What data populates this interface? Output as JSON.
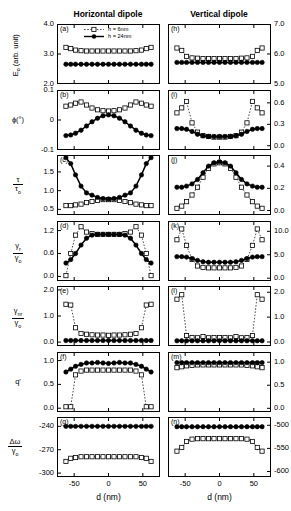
{
  "figure": {
    "columns": [
      {
        "title": "Horizontal dipole"
      },
      {
        "title": "Vertical dipole"
      }
    ],
    "xaxis_title": "d (nm)",
    "legend": [
      {
        "label": "h = 6nm",
        "style": "dashed-open-square"
      },
      {
        "label": "h = 24nm",
        "style": "solid-filled-circle"
      }
    ]
  },
  "chart_data": {
    "type": "line",
    "xlabel": "d (nm)",
    "xlim": [
      -75,
      75
    ],
    "xticks": [
      -50,
      0,
      50
    ],
    "grid": false,
    "legend_position": "panel-a-top",
    "series_names": [
      "h = 6nm",
      "h = 24nm"
    ],
    "x": [
      -62,
      -55,
      -48,
      -40,
      -32,
      -24,
      -16,
      -8,
      0,
      8,
      16,
      24,
      32,
      40,
      48,
      55,
      62
    ],
    "panels": [
      {
        "id": "a",
        "column": "Horizontal dipole",
        "ylabel": "E_o (arb. unit)",
        "ylim": [
          2.0,
          4.0
        ],
        "yticks": [
          2.0,
          3.0,
          4.0
        ],
        "ytick_labels": [
          "2.0",
          "3.0",
          "4.0"
        ],
        "axis_side": "left",
        "series": [
          {
            "name": "h = 6nm",
            "values": [
              3.22,
              3.18,
              3.13,
              3.11,
              3.1,
              3.1,
              3.1,
              3.1,
              3.1,
              3.1,
              3.1,
              3.1,
              3.1,
              3.11,
              3.13,
              3.18,
              3.22
            ]
          },
          {
            "name": "h = 24nm",
            "values": [
              2.66,
              2.66,
              2.66,
              2.66,
              2.66,
              2.66,
              2.66,
              2.66,
              2.66,
              2.66,
              2.66,
              2.66,
              2.66,
              2.66,
              2.66,
              2.66,
              2.66
            ]
          }
        ]
      },
      {
        "id": "b",
        "column": "Horizontal dipole",
        "ylabel": "phi (deg)",
        "ylim": [
          -0.1,
          0.1
        ],
        "yticks": [
          -0.1,
          0.0,
          0.1
        ],
        "ytick_labels": [
          "-0.1",
          "0",
          "0.1"
        ],
        "axis_side": "left",
        "series": [
          {
            "name": "h = 6nm",
            "values": [
              0.046,
              0.05,
              0.056,
              0.06,
              0.05,
              0.04,
              0.034,
              0.031,
              0.03,
              0.031,
              0.034,
              0.04,
              0.05,
              0.06,
              0.056,
              0.05,
              0.046
            ]
          },
          {
            "name": "h = 24nm",
            "values": [
              -0.052,
              -0.05,
              -0.044,
              -0.034,
              -0.02,
              -0.006,
              0.006,
              0.014,
              0.017,
              0.014,
              0.006,
              -0.006,
              -0.02,
              -0.034,
              -0.044,
              -0.05,
              -0.052
            ]
          }
        ]
      },
      {
        "id": "c",
        "column": "Horizontal dipole",
        "ylabel": "tau / tau_o",
        "ylim": [
          0.35,
          1.95
        ],
        "yticks": [
          0.5,
          1.0,
          1.5
        ],
        "ytick_labels": [
          "0.5",
          "1.0",
          "1.5"
        ],
        "axis_side": "left",
        "series": [
          {
            "name": "h = 6nm",
            "values": [
              0.6,
              0.6,
              0.62,
              0.64,
              0.68,
              0.71,
              0.74,
              0.76,
              0.76,
              0.76,
              0.74,
              0.71,
              0.68,
              0.64,
              0.62,
              0.6,
              0.6
            ]
          },
          {
            "name": "h = 24nm",
            "values": [
              1.88,
              1.72,
              1.42,
              1.12,
              0.94,
              0.88,
              0.82,
              0.79,
              0.78,
              0.79,
              0.82,
              0.88,
              0.94,
              1.12,
              1.42,
              1.72,
              1.88
            ]
          }
        ]
      },
      {
        "id": "d",
        "column": "Horizontal dipole",
        "ylabel": "gamma_r / gamma_o",
        "ylim": [
          -0.12,
          1.45
        ],
        "yticks": [
          0.0,
          0.6,
          1.2
        ],
        "ytick_labels": [
          "0.0",
          "0.6",
          "1.2"
        ],
        "axis_side": "left",
        "series": [
          {
            "name": "h = 6nm",
            "values": [
              0.02,
              0.6,
              1.08,
              1.3,
              1.16,
              1.12,
              1.1,
              1.1,
              1.1,
              1.1,
              1.1,
              1.12,
              1.16,
              1.3,
              1.08,
              0.6,
              0.02
            ]
          },
          {
            "name": "h = 24nm",
            "values": [
              0.35,
              0.44,
              0.6,
              0.82,
              1.0,
              1.08,
              1.1,
              1.1,
              1.1,
              1.1,
              1.1,
              1.08,
              1.0,
              0.82,
              0.6,
              0.44,
              0.35
            ]
          }
        ]
      },
      {
        "id": "e",
        "column": "Horizontal dipole",
        "ylabel": "gamma_nr / gamma_o",
        "ylim": [
          -0.15,
          2.15
        ],
        "yticks": [
          0.0,
          1.0,
          2.0
        ],
        "ytick_labels": [
          "0.0",
          "1.0",
          "2.0"
        ],
        "axis_side": "left",
        "series": [
          {
            "name": "h = 6nm",
            "values": [
              1.45,
              1.42,
              0.55,
              0.33,
              0.3,
              0.28,
              0.27,
              0.27,
              0.26,
              0.27,
              0.27,
              0.28,
              0.3,
              0.33,
              0.55,
              1.42,
              1.45
            ]
          },
          {
            "name": "h = 24nm",
            "values": [
              0.06,
              0.06,
              0.06,
              0.06,
              0.06,
              0.06,
              0.06,
              0.06,
              0.06,
              0.06,
              0.06,
              0.06,
              0.06,
              0.06,
              0.06,
              0.06,
              0.06
            ]
          }
        ]
      },
      {
        "id": "f",
        "column": "Horizontal dipole",
        "ylabel": "q'",
        "ylim": [
          -0.08,
          1.18
        ],
        "yticks": [
          0.0,
          0.5,
          1.0
        ],
        "ytick_labels": [
          "0.0",
          "0.5",
          "1.0"
        ],
        "axis_side": "left",
        "series": [
          {
            "name": "h = 6nm",
            "values": [
              0.03,
              0.03,
              0.7,
              0.78,
              0.8,
              0.8,
              0.8,
              0.8,
              0.8,
              0.8,
              0.8,
              0.8,
              0.8,
              0.78,
              0.7,
              0.03,
              0.03
            ]
          },
          {
            "name": "h = 24nm",
            "values": [
              0.76,
              0.82,
              0.88,
              0.92,
              0.95,
              0.95,
              0.96,
              0.95,
              0.94,
              0.95,
              0.96,
              0.95,
              0.95,
              0.92,
              0.88,
              0.82,
              0.76
            ]
          }
        ]
      },
      {
        "id": "g",
        "column": "Horizontal dipole",
        "ylabel": "delta omega / gamma_o",
        "ylim": [
          -305,
          -228
        ],
        "yticks": [
          -300,
          -270,
          -240
        ],
        "ytick_labels": [
          "-300",
          "-270",
          "-240"
        ],
        "axis_side": "left",
        "series": [
          {
            "name": "h = 6nm",
            "values": [
              -285,
              -281,
              -280,
              -279,
              -279,
              -279,
              -279,
              -279,
              -279,
              -279,
              -279,
              -279,
              -279,
              -279,
              -280,
              -281,
              -285
            ]
          },
          {
            "name": "h = 24nm",
            "values": [
              -240,
              -240,
              -240,
              -240,
              -240,
              -240,
              -240,
              -240,
              -240,
              -240,
              -240,
              -240,
              -240,
              -240,
              -240,
              -240,
              -240
            ]
          }
        ]
      },
      {
        "id": "h",
        "column": "Vertical dipole",
        "ylim": [
          5.0,
          7.0
        ],
        "yticks": [
          5.0,
          6.0,
          7.0
        ],
        "ytick_labels": [
          "5.0",
          "6.0",
          "7.0"
        ],
        "axis_side": "right",
        "series": [
          {
            "name": "h = 6nm",
            "values": [
              6.2,
              6.12,
              5.92,
              5.87,
              5.86,
              5.85,
              5.85,
              5.85,
              5.85,
              5.85,
              5.85,
              5.85,
              5.86,
              5.87,
              5.92,
              6.12,
              6.2
            ]
          },
          {
            "name": "h = 24nm",
            "values": [
              5.72,
              5.72,
              5.72,
              5.72,
              5.72,
              5.72,
              5.72,
              5.72,
              5.72,
              5.72,
              5.72,
              5.72,
              5.72,
              5.72,
              5.72,
              5.72,
              5.72
            ]
          }
        ]
      },
      {
        "id": "i",
        "column": "Vertical dipole",
        "ylim": [
          -0.06,
          0.78
        ],
        "yticks": [
          0.0,
          0.3,
          0.6
        ],
        "ytick_labels": [
          "0.0",
          "0.3",
          "0.6"
        ],
        "axis_side": "right",
        "series": [
          {
            "name": "h = 6nm",
            "values": [
              0.46,
              0.53,
              0.62,
              0.32,
              0.19,
              0.14,
              0.13,
              0.12,
              0.12,
              0.12,
              0.13,
              0.14,
              0.19,
              0.32,
              0.62,
              0.53,
              0.46
            ]
          },
          {
            "name": "h = 24nm",
            "values": [
              0.24,
              0.24,
              0.23,
              0.2,
              0.16,
              0.14,
              0.13,
              0.13,
              0.13,
              0.13,
              0.13,
              0.14,
              0.16,
              0.2,
              0.23,
              0.24,
              0.24
            ]
          }
        ]
      },
      {
        "id": "j",
        "column": "Vertical dipole",
        "ylim": [
          -0.04,
          0.5
        ],
        "yticks": [
          0.0,
          0.2,
          0.4
        ],
        "ytick_labels": [
          "0.0",
          "0.2",
          "0.4"
        ],
        "axis_side": "right",
        "series": [
          {
            "name": "h = 6nm",
            "values": [
              0.02,
              0.04,
              0.08,
              0.14,
              0.21,
              0.3,
              0.38,
              0.42,
              0.43,
              0.42,
              0.38,
              0.3,
              0.21,
              0.14,
              0.08,
              0.04,
              0.02
            ]
          },
          {
            "name": "h = 24nm",
            "values": [
              0.21,
              0.21,
              0.22,
              0.24,
              0.28,
              0.34,
              0.4,
              0.43,
              0.44,
              0.43,
              0.4,
              0.34,
              0.28,
              0.24,
              0.22,
              0.21,
              0.21
            ]
          }
        ]
      },
      {
        "id": "k",
        "column": "Vertical dipole",
        "ylim": [
          -0.6,
          12.2
        ],
        "yticks": [
          0.0,
          5.0,
          10.0
        ],
        "ytick_labels": [
          "0.0",
          "5.0",
          "10.0"
        ],
        "axis_side": "right",
        "series": [
          {
            "name": "h = 6nm",
            "values": [
              8.2,
              10.5,
              7.0,
              4.0,
              2.6,
              2.3,
              2.2,
              2.2,
              2.2,
              2.2,
              2.2,
              2.3,
              2.6,
              4.0,
              7.0,
              10.5,
              8.2
            ]
          },
          {
            "name": "h = 24nm",
            "values": [
              4.6,
              4.6,
              4.5,
              4.2,
              3.8,
              3.5,
              3.4,
              3.4,
              3.4,
              3.4,
              3.4,
              3.5,
              3.8,
              4.2,
              4.5,
              4.6,
              4.6
            ]
          }
        ]
      },
      {
        "id": "l",
        "column": "Vertical dipole",
        "ylim": [
          -0.16,
          2.25
        ],
        "yticks": [
          0.0,
          1.0,
          2.0
        ],
        "ytick_labels": [
          "0.0",
          "1.0",
          "2.0"
        ],
        "axis_side": "right",
        "series": [
          {
            "name": "h = 6nm",
            "values": [
              1.72,
              1.9,
              0.26,
              0.18,
              0.17,
              0.22,
              0.17,
              0.18,
              0.18,
              0.18,
              0.17,
              0.22,
              0.17,
              0.18,
              0.26,
              1.9,
              1.72
            ]
          },
          {
            "name": "h = 24nm",
            "values": [
              0.05,
              0.05,
              0.05,
              0.05,
              0.05,
              0.05,
              0.05,
              0.05,
              0.05,
              0.05,
              0.05,
              0.05,
              0.05,
              0.05,
              0.05,
              0.05,
              0.05
            ]
          }
        ]
      },
      {
        "id": "m",
        "column": "Vertical dipole",
        "ylim": [
          -0.08,
          1.22
        ],
        "yticks": [
          0.0,
          0.5,
          1.0
        ],
        "ytick_labels": [
          "0.0",
          "0.5",
          "1.0"
        ],
        "axis_side": "right",
        "series": [
          {
            "name": "h = 6nm",
            "values": [
              0.88,
              0.9,
              0.92,
              0.93,
              0.94,
              0.94,
              0.94,
              0.94,
              0.94,
              0.94,
              0.94,
              0.94,
              0.94,
              0.93,
              0.92,
              0.9,
              0.88
            ]
          },
          {
            "name": "h = 24nm",
            "values": [
              0.99,
              0.99,
              0.99,
              0.99,
              0.99,
              0.99,
              0.99,
              0.99,
              0.99,
              0.99,
              0.99,
              0.99,
              0.99,
              0.99,
              0.99,
              0.99,
              0.99
            ]
          }
        ]
      },
      {
        "id": "n",
        "column": "Vertical dipole",
        "ylim": [
          -612,
          -482
        ],
        "yticks": [
          -600,
          -550,
          -500
        ],
        "ytick_labels": [
          "-600",
          "-550",
          "-500"
        ],
        "axis_side": "right",
        "series": [
          {
            "name": "h = 6nm",
            "values": [
              -556,
              -548,
              -535,
              -530,
              -529,
              -529,
              -529,
              -529,
              -529,
              -529,
              -529,
              -529,
              -529,
              -530,
              -535,
              -548,
              -556
            ]
          },
          {
            "name": "h = 24nm",
            "values": [
              -503,
              -503,
              -503,
              -503,
              -503,
              -503,
              -503,
              -503,
              -503,
              -503,
              -503,
              -503,
              -503,
              -503,
              -503,
              -503,
              -503
            ]
          }
        ]
      }
    ]
  },
  "ylabels": {
    "a": {
      "text": "E",
      "sub": "o",
      "tail": " (arb. unit)"
    },
    "b": {
      "text": "ϕ(°)"
    },
    "c": {
      "num": "τ",
      "den": "τ",
      "den_sub": "o"
    },
    "d": {
      "num": "γ",
      "num_sub": "r",
      "den": "γ",
      "den_sub": "o"
    },
    "e": {
      "num": "γ",
      "num_sub": "nr",
      "den": "γ",
      "den_sub": "o"
    },
    "f": {
      "text": "q'"
    },
    "g": {
      "num": "Δω",
      "den": "γ",
      "den_sub": "o"
    }
  },
  "panel_labels": {
    "a": "(a)",
    "b": "(b)",
    "c": "(c)",
    "d": "(d)",
    "e": "(e)",
    "f": "(f)",
    "g": "(g)",
    "h": "(h)",
    "i": "(i)",
    "j": "(j)",
    "k": "(k)",
    "l": "(l)",
    "m": "(m)",
    "n": "(n)"
  },
  "xticks": {
    "left": "-50",
    "mid": "0",
    "right": "50"
  }
}
